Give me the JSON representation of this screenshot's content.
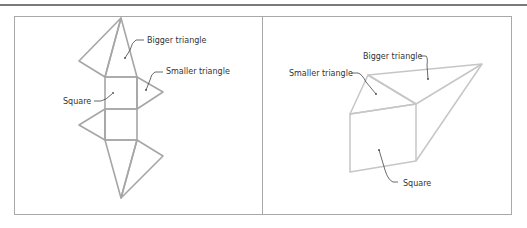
{
  "left_figure": {
    "description": "Net of a triangular prism",
    "labels": {
      "bigger_triangle": "Bigger triangle",
      "smaller_triangle": "Smaller triangle",
      "square": "Square"
    }
  },
  "right_figure": {
    "description": "Folded triangular prism",
    "labels": {
      "bigger_triangle": "Bigger triangle",
      "smaller_triangle": "Smaller triangle",
      "square": "Square"
    }
  },
  "colors": {
    "net_stroke": "#a6a6a6",
    "prism_stroke": "#c6c6c6",
    "border": "#a8a8a8",
    "rule": "#7a7a7a"
  }
}
